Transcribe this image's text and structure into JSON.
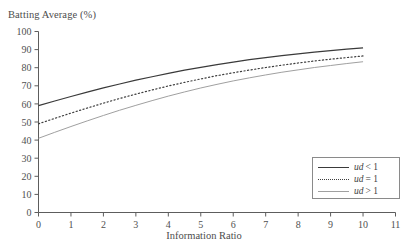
{
  "chart_data": {
    "type": "line",
    "title": "Batting Average (%)",
    "xlabel": "Information Ratio",
    "ylabel": "Batting Average (%)",
    "xlim": [
      0,
      11
    ],
    "ylim": [
      0,
      100
    ],
    "xticks": [
      "0",
      "1",
      "2",
      "3",
      "4",
      "5",
      "6",
      "7",
      "8",
      "9",
      "10",
      "11"
    ],
    "yticks": [
      "0",
      "10",
      "20",
      "30",
      "40",
      "50",
      "60",
      "70",
      "80",
      "90",
      "100"
    ],
    "grid": false,
    "legend_position": "bottom-right",
    "x": [
      0,
      0.5,
      1,
      1.5,
      2,
      2.5,
      3,
      3.5,
      4,
      4.5,
      5,
      5.5,
      6,
      6.5,
      7,
      7.5,
      8,
      8.5,
      9,
      9.5,
      10
    ],
    "series": [
      {
        "name": "ud < 1",
        "style": "solid-dark",
        "color": "#3a3a3a",
        "values": [
          59.0,
          61.6,
          64.1,
          66.5,
          68.8,
          71.0,
          73.1,
          75.0,
          76.9,
          78.6,
          80.2,
          81.7,
          83.1,
          84.4,
          85.6,
          86.7,
          87.7,
          88.6,
          89.4,
          90.2,
          91.0
        ]
      },
      {
        "name": "ud = 1",
        "style": "dotted",
        "color": "#3f3f3f",
        "values": [
          49.0,
          52.0,
          54.9,
          57.7,
          60.4,
          63.0,
          65.4,
          67.7,
          69.9,
          71.9,
          73.8,
          75.6,
          77.2,
          78.7,
          80.1,
          81.4,
          82.6,
          83.7,
          84.7,
          85.6,
          86.5
        ]
      },
      {
        "name": "ud > 1",
        "style": "solid-light",
        "color": "#a0a0a0",
        "values": [
          41.0,
          44.3,
          47.5,
          50.6,
          53.6,
          56.5,
          59.2,
          61.8,
          64.3,
          66.6,
          68.8,
          70.8,
          72.7,
          74.4,
          76.0,
          77.5,
          78.8,
          80.1,
          81.2,
          82.3,
          83.3
        ]
      }
    ]
  },
  "legend": {
    "items": [
      {
        "variable": "ud",
        "relation": "< 1"
      },
      {
        "variable": "ud",
        "relation": "= 1"
      },
      {
        "variable": "ud",
        "relation": "> 1"
      }
    ]
  }
}
